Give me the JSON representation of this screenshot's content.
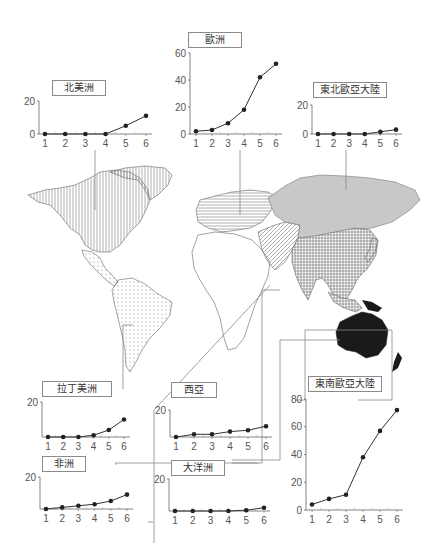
{
  "figure": {
    "colors": {
      "line": "#333333",
      "axis": "#666666",
      "leader": "#888888",
      "northeast_eurasia_fill": "#c8c8c8",
      "oceania_fill": "#1a1a1a"
    }
  },
  "chart_data": [
    {
      "id": "north_america",
      "type": "line",
      "title": "北美洲",
      "categories": [
        "1",
        "2",
        "3",
        "4",
        "5",
        "6"
      ],
      "values": [
        0,
        0,
        0,
        0,
        5,
        11
      ],
      "yticks": [
        0,
        20
      ],
      "ylim": [
        0,
        20
      ],
      "map_pattern": "vertical-lines"
    },
    {
      "id": "europe",
      "type": "line",
      "title": "歐洲",
      "categories": [
        "1",
        "2",
        "3",
        "4",
        "5",
        "6"
      ],
      "values": [
        2,
        3,
        8,
        18,
        42,
        52
      ],
      "yticks": [
        0,
        20,
        40,
        60
      ],
      "ylim": [
        0,
        60
      ],
      "map_pattern": "horizontal-lines"
    },
    {
      "id": "northeast_eurasia",
      "type": "line",
      "title": "東北歐亞大陸",
      "categories": [
        "1",
        "2",
        "3",
        "4",
        "5",
        "6"
      ],
      "values": [
        0,
        0,
        0,
        0,
        1.5,
        3
      ],
      "yticks": [
        0,
        20
      ],
      "ylim": [
        0,
        20
      ],
      "map_pattern": "gray-fill"
    },
    {
      "id": "latin_america",
      "type": "line",
      "title": "拉丁美洲",
      "categories": [
        "1",
        "2",
        "3",
        "4",
        "5",
        "6"
      ],
      "values": [
        0,
        0,
        0,
        1,
        4,
        10
      ],
      "yticks": [
        20
      ],
      "ylim": [
        0,
        20
      ],
      "map_pattern": "dots"
    },
    {
      "id": "africa",
      "type": "line",
      "title": "非洲",
      "categories": [
        "1",
        "2",
        "3",
        "4",
        "5",
        "6"
      ],
      "values": [
        0,
        1,
        2,
        3,
        5,
        9
      ],
      "yticks": [
        20
      ],
      "ylim": [
        0,
        20
      ],
      "map_pattern": "blank"
    },
    {
      "id": "west_asia",
      "type": "line",
      "title": "西亞",
      "categories": [
        "1",
        "2",
        "3",
        "4",
        "5",
        "6"
      ],
      "values": [
        0,
        2,
        2,
        4,
        5,
        8
      ],
      "yticks": [
        20
      ],
      "ylim": [
        0,
        20
      ],
      "map_pattern": "diagonal-lines"
    },
    {
      "id": "oceania",
      "type": "line",
      "title": "大洋洲",
      "categories": [
        "1",
        "2",
        "3",
        "4",
        "5",
        "6"
      ],
      "values": [
        0,
        0,
        0,
        0,
        0.5,
        2
      ],
      "yticks": [
        20
      ],
      "ylim": [
        0,
        20
      ],
      "map_pattern": "black-fill"
    },
    {
      "id": "southeast_eurasia",
      "type": "line",
      "title": "東南歐亞大陸",
      "categories": [
        "1",
        "2",
        "3",
        "4",
        "5",
        "6"
      ],
      "values": [
        4,
        8,
        11,
        38,
        57,
        72
      ],
      "yticks": [
        0,
        20,
        40,
        60,
        80
      ],
      "ylim": [
        0,
        80
      ],
      "map_pattern": "crosshatch"
    }
  ]
}
